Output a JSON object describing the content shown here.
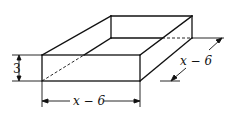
{
  "diagram": {
    "labels": {
      "height": "3",
      "width": "x − 6",
      "depth": "x − 6"
    },
    "colors": {
      "stroke": "#111111",
      "background": "#ffffff"
    }
  }
}
